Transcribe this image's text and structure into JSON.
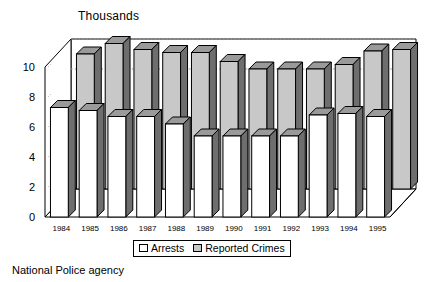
{
  "chart_data": {
    "type": "bar",
    "title": "Thousands",
    "subtitle": "",
    "xlabel": "",
    "ylabel": "Thousands",
    "ylim": [
      0,
      10
    ],
    "yticks": [
      0,
      2,
      4,
      6,
      8,
      10
    ],
    "grid": true,
    "grid_note": "dotted horizontal gridlines on back wall at 8 and 10",
    "legend_position": "bottom-center",
    "three_d": true,
    "categories": [
      "1984",
      "1985",
      "1986",
      "1987",
      "1988",
      "1989",
      "1990",
      "1991",
      "1992",
      "1993",
      "1994",
      "1995"
    ],
    "series": [
      {
        "name": "Arrests",
        "color": "#ffffff",
        "row": "front",
        "values": [
          7.3,
          7.1,
          6.7,
          6.7,
          6.2,
          5.4,
          5.4,
          5.4,
          5.4,
          6.8,
          6.9,
          6.7
        ]
      },
      {
        "name": "Reported Crimes",
        "color": "#c8c8c8",
        "row": "back",
        "values": [
          9.0,
          9.7,
          9.3,
          9.1,
          9.1,
          8.5,
          8.0,
          8.0,
          8.0,
          8.3,
          9.2,
          9.3
        ]
      }
    ]
  },
  "title": {
    "text": "Thousands"
  },
  "legend": {
    "items": [
      {
        "label": "Arrests",
        "swatch": "white-square-icon"
      },
      {
        "label": "Reported Crimes",
        "swatch": "gray-square-icon"
      }
    ]
  },
  "caption": {
    "text": "National Police agency"
  },
  "colors": {
    "bar_front_fill": "#ffffff",
    "bar_back_fill": "#c8c8c8",
    "bar_side_shade": "#6e6e6e",
    "bar_top_shade": "#9a9a9a",
    "outline": "#000000",
    "wall": "#ffffff",
    "gridline": "#9a9a9a"
  }
}
